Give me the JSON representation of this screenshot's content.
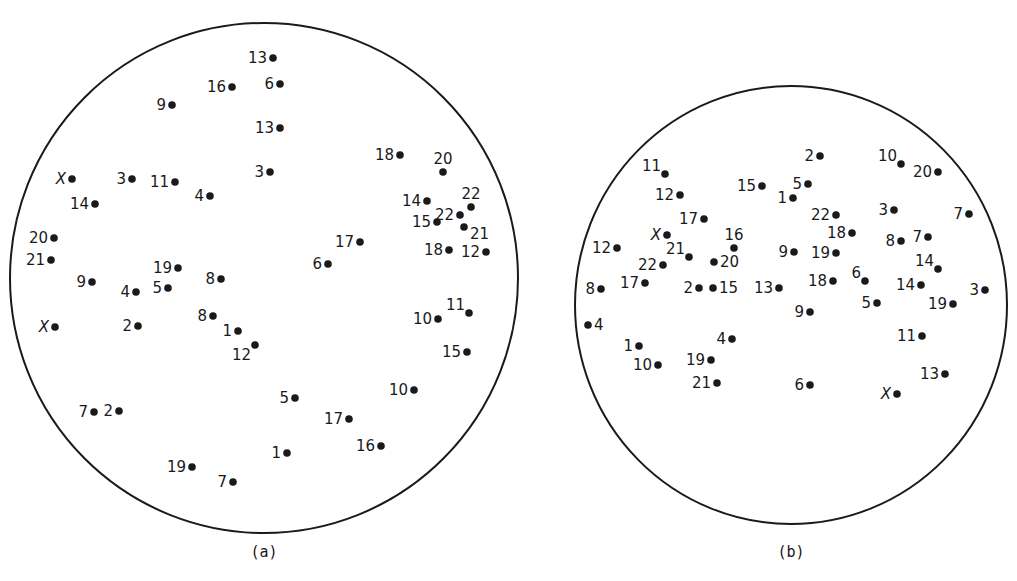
{
  "figure": {
    "panels": [
      {
        "id": "a",
        "caption": "(a)",
        "circle": {
          "cx": 264,
          "cy": 278,
          "rx": 254,
          "ry": 255
        },
        "caption_pos": {
          "x": 264,
          "y": 557
        },
        "points": [
          {
            "label": "13",
            "x": 273,
            "y": 58,
            "side": "left"
          },
          {
            "label": "16",
            "x": 232,
            "y": 87,
            "side": "left"
          },
          {
            "label": "6",
            "x": 280,
            "y": 84,
            "side": "left"
          },
          {
            "label": "9",
            "x": 172,
            "y": 105,
            "side": "left"
          },
          {
            "label": "13",
            "x": 280,
            "y": 128,
            "side": "left"
          },
          {
            "label": "3",
            "x": 270,
            "y": 172,
            "side": "left"
          },
          {
            "label": "X",
            "x": 72,
            "y": 179,
            "side": "left"
          },
          {
            "label": "3",
            "x": 132,
            "y": 179,
            "side": "left"
          },
          {
            "label": "11",
            "x": 175,
            "y": 182,
            "side": "left"
          },
          {
            "label": "4",
            "x": 210,
            "y": 196,
            "side": "left"
          },
          {
            "label": "14",
            "x": 95,
            "y": 204,
            "side": "left"
          },
          {
            "label": "20",
            "x": 54,
            "y": 238,
            "side": "left"
          },
          {
            "label": "21",
            "x": 51,
            "y": 260,
            "side": "left"
          },
          {
            "label": "19",
            "x": 178,
            "y": 268,
            "side": "left"
          },
          {
            "label": "8",
            "x": 221,
            "y": 279,
            "side": "left"
          },
          {
            "label": "9",
            "x": 92,
            "y": 282,
            "side": "left"
          },
          {
            "label": "4",
            "x": 136,
            "y": 292,
            "side": "left"
          },
          {
            "label": "5",
            "x": 168,
            "y": 288,
            "side": "left"
          },
          {
            "label": "8",
            "x": 213,
            "y": 316,
            "side": "left"
          },
          {
            "label": "X",
            "x": 55,
            "y": 327,
            "side": "left"
          },
          {
            "label": "2",
            "x": 138,
            "y": 326,
            "side": "left"
          },
          {
            "label": "1",
            "x": 238,
            "y": 331,
            "side": "left"
          },
          {
            "label": "12",
            "x": 255,
            "y": 345,
            "side": "below-left"
          },
          {
            "label": "7",
            "x": 94,
            "y": 412,
            "side": "left"
          },
          {
            "label": "2",
            "x": 119,
            "y": 411,
            "side": "left"
          },
          {
            "label": "5",
            "x": 295,
            "y": 398,
            "side": "left"
          },
          {
            "label": "1",
            "x": 287,
            "y": 453,
            "side": "left"
          },
          {
            "label": "19",
            "x": 192,
            "y": 467,
            "side": "left"
          },
          {
            "label": "7",
            "x": 233,
            "y": 482,
            "side": "left"
          },
          {
            "label": "18",
            "x": 400,
            "y": 155,
            "side": "left"
          },
          {
            "label": "20",
            "x": 443,
            "y": 172,
            "side": "above"
          },
          {
            "label": "14",
            "x": 427,
            "y": 201,
            "side": "left"
          },
          {
            "label": "22",
            "x": 471,
            "y": 207,
            "side": "above"
          },
          {
            "label": "22",
            "x": 460,
            "y": 215,
            "side": "left"
          },
          {
            "label": "15",
            "x": 437,
            "y": 222,
            "side": "left"
          },
          {
            "label": "21",
            "x": 464,
            "y": 227,
            "side": "right-below"
          },
          {
            "label": "18",
            "x": 449,
            "y": 250,
            "side": "left"
          },
          {
            "label": "12",
            "x": 486,
            "y": 252,
            "side": "left"
          },
          {
            "label": "17",
            "x": 360,
            "y": 242,
            "side": "left"
          },
          {
            "label": "6",
            "x": 328,
            "y": 264,
            "side": "left"
          },
          {
            "label": "10",
            "x": 438,
            "y": 319,
            "side": "left"
          },
          {
            "label": "11",
            "x": 469,
            "y": 313,
            "side": "above-left"
          },
          {
            "label": "15",
            "x": 467,
            "y": 352,
            "side": "left"
          },
          {
            "label": "10",
            "x": 414,
            "y": 390,
            "side": "left"
          },
          {
            "label": "17",
            "x": 349,
            "y": 419,
            "side": "left"
          },
          {
            "label": "16",
            "x": 381,
            "y": 446,
            "side": "left"
          }
        ]
      },
      {
        "id": "b",
        "caption": "(b)",
        "circle": {
          "cx": 791,
          "cy": 305,
          "rx": 216,
          "ry": 219
        },
        "caption_pos": {
          "x": 791,
          "y": 557
        },
        "points": [
          {
            "label": "2",
            "x": 820,
            "y": 156,
            "side": "left"
          },
          {
            "label": "10",
            "x": 901,
            "y": 164,
            "side": "above-left"
          },
          {
            "label": "20",
            "x": 938,
            "y": 172,
            "side": "left"
          },
          {
            "label": "11",
            "x": 665,
            "y": 174,
            "side": "above-left"
          },
          {
            "label": "15",
            "x": 762,
            "y": 186,
            "side": "left"
          },
          {
            "label": "5",
            "x": 808,
            "y": 184,
            "side": "left"
          },
          {
            "label": "1",
            "x": 793,
            "y": 198,
            "side": "left"
          },
          {
            "label": "12",
            "x": 680,
            "y": 195,
            "side": "left"
          },
          {
            "label": "22",
            "x": 836,
            "y": 215,
            "side": "left"
          },
          {
            "label": "3",
            "x": 894,
            "y": 210,
            "side": "left"
          },
          {
            "label": "7",
            "x": 969,
            "y": 214,
            "side": "left"
          },
          {
            "label": "17",
            "x": 704,
            "y": 219,
            "side": "left"
          },
          {
            "label": "18",
            "x": 852,
            "y": 233,
            "side": "left"
          },
          {
            "label": "X",
            "x": 667,
            "y": 235,
            "side": "left"
          },
          {
            "label": "8",
            "x": 901,
            "y": 241,
            "side": "left"
          },
          {
            "label": "7",
            "x": 928,
            "y": 237,
            "side": "left"
          },
          {
            "label": "16",
            "x": 734,
            "y": 248,
            "side": "above"
          },
          {
            "label": "12",
            "x": 617,
            "y": 248,
            "side": "left"
          },
          {
            "label": "9",
            "x": 794,
            "y": 252,
            "side": "left"
          },
          {
            "label": "19",
            "x": 836,
            "y": 253,
            "side": "left"
          },
          {
            "label": "21",
            "x": 689,
            "y": 257,
            "side": "above-left"
          },
          {
            "label": "20",
            "x": 714,
            "y": 262,
            "side": "right"
          },
          {
            "label": "22",
            "x": 663,
            "y": 265,
            "side": "left"
          },
          {
            "label": "14",
            "x": 938,
            "y": 269,
            "side": "above-left"
          },
          {
            "label": "17",
            "x": 645,
            "y": 283,
            "side": "left"
          },
          {
            "label": "18",
            "x": 833,
            "y": 281,
            "side": "left"
          },
          {
            "label": "6",
            "x": 865,
            "y": 281,
            "side": "above-left"
          },
          {
            "label": "14",
            "x": 921,
            "y": 285,
            "side": "left"
          },
          {
            "label": "2",
            "x": 699,
            "y": 288,
            "side": "left"
          },
          {
            "label": "15",
            "x": 713,
            "y": 288,
            "side": "right"
          },
          {
            "label": "13",
            "x": 779,
            "y": 288,
            "side": "left"
          },
          {
            "label": "8",
            "x": 601,
            "y": 289,
            "side": "left"
          },
          {
            "label": "3",
            "x": 985,
            "y": 290,
            "side": "left"
          },
          {
            "label": "5",
            "x": 877,
            "y": 303,
            "side": "left"
          },
          {
            "label": "19",
            "x": 953,
            "y": 304,
            "side": "left"
          },
          {
            "label": "9",
            "x": 810,
            "y": 312,
            "side": "left"
          },
          {
            "label": "4",
            "x": 588,
            "y": 325,
            "side": "right"
          },
          {
            "label": "11",
            "x": 922,
            "y": 336,
            "side": "left"
          },
          {
            "label": "4",
            "x": 732,
            "y": 339,
            "side": "left"
          },
          {
            "label": "1",
            "x": 639,
            "y": 346,
            "side": "left"
          },
          {
            "label": "19",
            "x": 711,
            "y": 360,
            "side": "left"
          },
          {
            "label": "10",
            "x": 658,
            "y": 365,
            "side": "left"
          },
          {
            "label": "13",
            "x": 945,
            "y": 374,
            "side": "left"
          },
          {
            "label": "21",
            "x": 717,
            "y": 383,
            "side": "left"
          },
          {
            "label": "6",
            "x": 810,
            "y": 385,
            "side": "left"
          },
          {
            "label": "X",
            "x": 897,
            "y": 394,
            "side": "left"
          }
        ]
      }
    ]
  }
}
